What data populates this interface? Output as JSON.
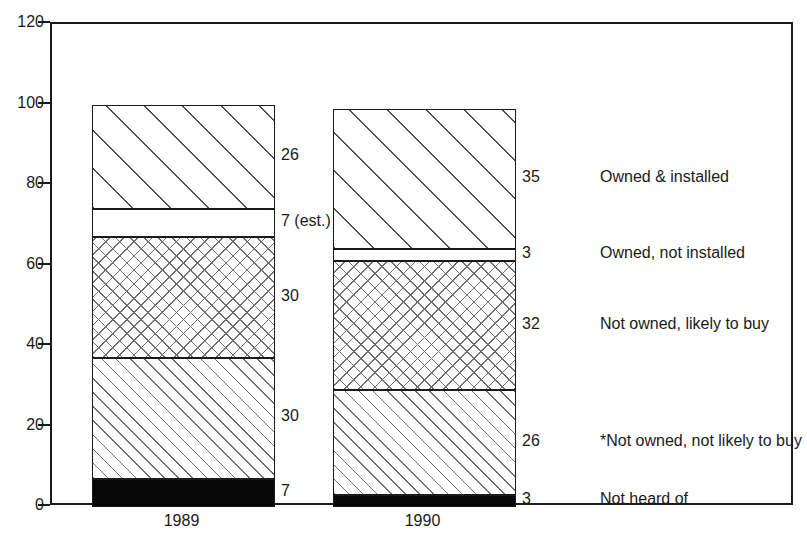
{
  "chart_data": {
    "type": "bar",
    "variant": "stacked",
    "title": "",
    "subtitle": "",
    "xlabel": "",
    "ylabel": "",
    "categories": [
      "1989",
      "1990"
    ],
    "ylim": [
      0,
      120
    ],
    "yticks": [
      0,
      20,
      40,
      60,
      80,
      100,
      120
    ],
    "ytick_labels": [
      "0",
      "20",
      "40",
      "60",
      "80",
      "100",
      "120"
    ],
    "grid": false,
    "legend_position": "right",
    "series": [
      {
        "name": "Not heard of",
        "fill": "solid-black",
        "values": [
          7,
          3
        ],
        "value_labels": [
          "7",
          "3"
        ]
      },
      {
        "name": "*Not owned, not likely to buy",
        "fill": "hatch-fine",
        "values": [
          30,
          26
        ],
        "value_labels": [
          "30",
          "26"
        ]
      },
      {
        "name": "Not owned, likely to buy",
        "fill": "hatch-cross",
        "values": [
          30,
          32
        ],
        "value_labels": [
          "30",
          "32"
        ]
      },
      {
        "name": "Owned, not installed",
        "fill": "blank",
        "values": [
          7,
          3
        ],
        "value_labels": [
          "7 (est.)",
          "3"
        ]
      },
      {
        "name": "Owned & installed",
        "fill": "hatch-coarse",
        "values": [
          26,
          35
        ],
        "value_labels": [
          "26",
          "35"
        ]
      }
    ],
    "totals": [
      100,
      99
    ],
    "legend_entries": [
      "Owned & installed",
      "Owned, not installed",
      "Not owned, likely to buy",
      "*Not owned, not likely to buy",
      "Not heard of"
    ],
    "colors": {
      "axis": "#1a1a1a",
      "text": "#1a1a1a",
      "background": "#ffffff",
      "solid_segment": "#060606",
      "hatch_line": "#6f6f6f"
    }
  },
  "axis": {
    "y_labels": [
      "120",
      "100",
      "80",
      "60",
      "40",
      "20",
      "0"
    ],
    "x_labels": [
      "1989",
      "1990"
    ]
  },
  "bar_value_labels": {
    "1989": [
      "26",
      "7 (est.)",
      "30",
      "30",
      "7"
    ],
    "1990": [
      "35",
      "3",
      "32",
      "26",
      "3"
    ]
  },
  "legend": {
    "items": [
      "Owned & installed",
      "Owned, not installed",
      "Not owned, likely to buy",
      "*Not owned, not likely to buy",
      "Not heard of"
    ]
  }
}
